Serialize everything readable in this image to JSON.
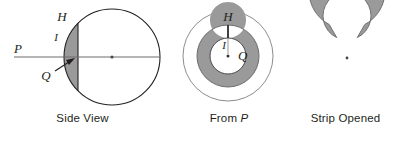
{
  "figure": {
    "background_color": "#ffffff",
    "line_color": "#231f20",
    "shade_color": "#9a9a9a",
    "shade_color_light": "#b7b7b7",
    "panels": [
      {
        "id": "side-view",
        "caption": "Side View",
        "caption_italic_part": "",
        "labels": {
          "p": "P",
          "h": "H",
          "i": "I",
          "q": "Q"
        },
        "geometry": {
          "circle_center_x": 112,
          "circle_center_y": 57,
          "circle_radius": 48,
          "cap_plane_x": 78,
          "ray_start_x": 14,
          "ray_end_x": 160
        }
      },
      {
        "id": "from-p",
        "caption_prefix": "From ",
        "caption_italic_part": "P",
        "caption": "From P",
        "labels": {
          "h": "H",
          "i": "I",
          "q": "Q"
        },
        "geometry": {
          "center_x": 63,
          "center_y": 56,
          "outer_circle_radius": 45,
          "annulus_outer_radius": 31,
          "annulus_inner_radius": 18
        }
      },
      {
        "id": "strip-opened",
        "caption": "Strip Opened",
        "caption_italic_part": "",
        "labels": {},
        "geometry": {
          "center_x": 54,
          "center_y": 58,
          "outer_radius": 38,
          "inner_radius": 24,
          "gap_start_deg": 62,
          "gap_end_deg": 118
        }
      }
    ]
  }
}
